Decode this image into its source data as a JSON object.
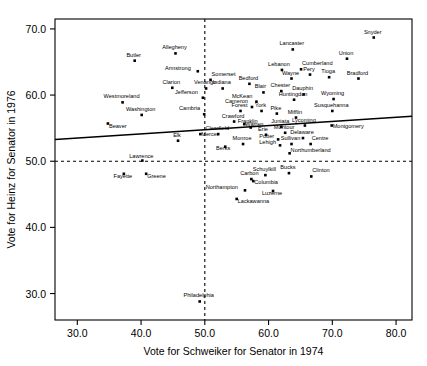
{
  "chart_data": {
    "type": "scatter",
    "title": "",
    "xlabel": "Vote for Schweiker for Senator in 1974",
    "ylabel": "Vote for Heinz for Senator in 1976",
    "xlim": [
      26.5,
      82.5
    ],
    "ylim": [
      26.0,
      71.5
    ],
    "xticks": [
      30.0,
      40.0,
      50.0,
      60.0,
      70.0,
      80.0
    ],
    "yticks": [
      30.0,
      40.0,
      50.0,
      60.0,
      70.0
    ],
    "xticklabels": [
      "30.0",
      "40.0",
      "50.0",
      "60.0",
      "70.0",
      "80.0"
    ],
    "yticklabels": [
      "30.0",
      "40.0",
      "50.0",
      "60.0",
      "70.0"
    ],
    "grid": false,
    "legend": null,
    "reference_lines": [
      {
        "name": "horizontal-50-percent-line",
        "orientation": "horizontal",
        "value": 50.0,
        "style": "dashed"
      },
      {
        "name": "vertical-50-percent-line",
        "orientation": "vertical",
        "value": 50.0,
        "style": "dashed"
      }
    ],
    "fit_line": {
      "name": "regression-line",
      "style": "solid",
      "x0": 26.5,
      "y0": 53.3,
      "x1": 82.5,
      "y1": 56.8
    },
    "point_label_field": "county",
    "points": [
      {
        "county": "Butler",
        "x": 39.0,
        "y": 65.2,
        "lx": -1,
        "ly": -4
      },
      {
        "county": "Allegheny",
        "x": 45.4,
        "y": 66.3,
        "lx": -1,
        "ly": -4
      },
      {
        "county": "Armstrong",
        "x": 48.9,
        "y": 63.6,
        "lx": -7,
        "ly": -1
      },
      {
        "county": "Somerset",
        "x": 50.9,
        "y": 62.3,
        "lx": 1,
        "ly": -4
      },
      {
        "county": "Clarion",
        "x": 44.9,
        "y": 61.1,
        "lx": -1,
        "ly": -4
      },
      {
        "county": "Venango",
        "x": 50.2,
        "y": 61.0,
        "lx": -1,
        "ly": -4
      },
      {
        "county": "Indiana",
        "x": 52.8,
        "y": 61.0,
        "lx": -1,
        "ly": -4
      },
      {
        "county": "Westmoreland",
        "x": 37.1,
        "y": 58.9,
        "lx": -1,
        "ly": -4
      },
      {
        "county": "Jefferson",
        "x": 49.7,
        "y": 59.6,
        "lx": -5,
        "ly": -4
      },
      {
        "county": "Washington",
        "x": 40.1,
        "y": 57.0,
        "lx": -1,
        "ly": -4
      },
      {
        "county": "Cambria",
        "x": 49.9,
        "y": 57.1,
        "lx": -4,
        "ly": -4
      },
      {
        "county": "Beaver",
        "x": 34.8,
        "y": 55.7,
        "lx": 1,
        "ly": 4
      },
      {
        "county": "Elk",
        "x": 45.8,
        "y": 53.1,
        "lx": -1,
        "ly": -4
      },
      {
        "county": "Lancaster",
        "x": 63.8,
        "y": 66.9,
        "lx": -1,
        "ly": -4
      },
      {
        "county": "Snyder",
        "x": 76.5,
        "y": 68.7,
        "lx": -1,
        "ly": -4
      },
      {
        "county": "Union",
        "x": 72.3,
        "y": 65.5,
        "lx": -1,
        "ly": -4
      },
      {
        "county": "Lebanon",
        "x": 62.1,
        "y": 63.8,
        "lx": -3,
        "ly": -4
      },
      {
        "county": "Cumberland",
        "x": 65.1,
        "y": 63.9,
        "lx": 1,
        "ly": -4
      },
      {
        "county": "Wayne",
        "x": 63.6,
        "y": 62.5,
        "lx": -1,
        "ly": -4
      },
      {
        "county": "Pery",
        "x": 66.5,
        "y": 63.1,
        "lx": -1,
        "ly": -4
      },
      {
        "county": "Tioga",
        "x": 69.5,
        "y": 62.7,
        "lx": -1,
        "ly": -4
      },
      {
        "county": "Bradford",
        "x": 74.1,
        "y": 62.5,
        "lx": -1,
        "ly": -4
      },
      {
        "county": "Bedford",
        "x": 57.0,
        "y": 61.7,
        "lx": -1,
        "ly": -4
      },
      {
        "county": "Blair",
        "x": 59.2,
        "y": 60.4,
        "lx": -3,
        "ly": -4
      },
      {
        "county": "Chester",
        "x": 62.0,
        "y": 60.6,
        "lx": -1,
        "ly": -4
      },
      {
        "county": "Dauphin",
        "x": 65.5,
        "y": 60.1,
        "lx": -1,
        "ly": -4
      },
      {
        "county": "McKean",
        "x": 58.1,
        "y": 59.0,
        "lx": -4,
        "ly": -4
      },
      {
        "county": "Huntingdon",
        "x": 64.0,
        "y": 59.3,
        "lx": -1,
        "ly": -4
      },
      {
        "county": "Wyoming",
        "x": 70.2,
        "y": 59.4,
        "lx": -1,
        "ly": -4
      },
      {
        "county": "Cameron",
        "x": 57.4,
        "y": 58.2,
        "lx": -4,
        "ly": -4
      },
      {
        "county": "York",
        "x": 58.9,
        "y": 57.6,
        "lx": -1,
        "ly": -4
      },
      {
        "county": "Pike",
        "x": 61.3,
        "y": 57.2,
        "lx": -1,
        "ly": -4
      },
      {
        "county": "Susquehanna",
        "x": 70.0,
        "y": 57.6,
        "lx": -1,
        "ly": -4
      },
      {
        "county": "Forest",
        "x": 55.6,
        "y": 57.6,
        "lx": -1,
        "ly": -4
      },
      {
        "county": "Montgomery",
        "x": 69.9,
        "y": 55.4,
        "lx": 1,
        "ly": 2
      },
      {
        "county": "Crawford",
        "x": 54.6,
        "y": 56.0,
        "lx": -1,
        "ly": -4
      },
      {
        "county": "Mifflin",
        "x": 64.3,
        "y": 56.6,
        "lx": -1,
        "ly": -4
      },
      {
        "county": "Warren",
        "x": 56.2,
        "y": 55.6,
        "lx": 1,
        "ly": 2
      },
      {
        "county": "Juniata",
        "x": 62.0,
        "y": 55.2,
        "lx": -1,
        "ly": -4
      },
      {
        "county": "Lycoming",
        "x": 65.7,
        "y": 55.4,
        "lx": -1,
        "ly": -4
      },
      {
        "county": "Mercer",
        "x": 49.3,
        "y": 54.1,
        "lx": 1,
        "ly": 2
      },
      {
        "county": "Clearfield",
        "x": 52.1,
        "y": 54.1,
        "lx": -1,
        "ly": -4
      },
      {
        "county": "Franklin",
        "x": 57.2,
        "y": 55.1,
        "lx": -3,
        "ly": -4
      },
      {
        "county": "Erie",
        "x": 59.6,
        "y": 54.0,
        "lx": -3,
        "ly": -4
      },
      {
        "county": "Montour",
        "x": 62.6,
        "y": 54.3,
        "lx": -1,
        "ly": -4
      },
      {
        "county": "Delaware",
        "x": 65.4,
        "y": 53.5,
        "lx": -1,
        "ly": -4
      },
      {
        "county": "Potter",
        "x": 61.5,
        "y": 53.3,
        "lx": -4,
        "ly": -1
      },
      {
        "county": "Sullivan",
        "x": 63.6,
        "y": 52.6,
        "lx": -1,
        "ly": -4
      },
      {
        "county": "Centre",
        "x": 66.6,
        "y": 52.6,
        "lx": 1,
        "ly": -4
      },
      {
        "county": "Lehigh",
        "x": 61.8,
        "y": 52.4,
        "lx": -4,
        "ly": -1
      },
      {
        "county": "Berks",
        "x": 53.2,
        "y": 52.2,
        "lx": -2,
        "ly": 3
      },
      {
        "county": "Monroe",
        "x": 56.0,
        "y": 52.6,
        "lx": -1,
        "ly": -4
      },
      {
        "county": "Northumberland",
        "x": 63.3,
        "y": 51.2,
        "lx": 1,
        "ly": -1
      },
      {
        "county": "Lawrence",
        "x": 40.2,
        "y": 50.1,
        "lx": -1,
        "ly": -3
      },
      {
        "county": "Fayette",
        "x": 37.3,
        "y": 48.1,
        "lx": -1,
        "ly": 4
      },
      {
        "county": "Greene",
        "x": 40.8,
        "y": 48.1,
        "lx": 1,
        "ly": 4
      },
      {
        "county": "Schuylkill",
        "x": 59.5,
        "y": 47.9,
        "lx": -1,
        "ly": -4
      },
      {
        "county": "Bucks",
        "x": 63.2,
        "y": 48.2,
        "lx": -1,
        "ly": -4
      },
      {
        "county": "Clinton",
        "x": 66.7,
        "y": 47.7,
        "lx": 1,
        "ly": -4
      },
      {
        "county": "Carbon",
        "x": 57.3,
        "y": 47.3,
        "lx": -2,
        "ly": -4
      },
      {
        "county": "Columbia",
        "x": 57.6,
        "y": 47.0,
        "lx": 1,
        "ly": 3
      },
      {
        "county": "Northampton",
        "x": 56.3,
        "y": 45.6,
        "lx": -7,
        "ly": -1
      },
      {
        "county": "Luzerne",
        "x": 60.7,
        "y": 45.5,
        "lx": -1,
        "ly": 4
      },
      {
        "county": "Lackawanna",
        "x": 55.0,
        "y": 44.3,
        "lx": 1,
        "ly": 4
      },
      {
        "county": "Philadelphia",
        "x": 49.2,
        "y": 28.8,
        "lx": -1,
        "ly": -4
      }
    ]
  }
}
